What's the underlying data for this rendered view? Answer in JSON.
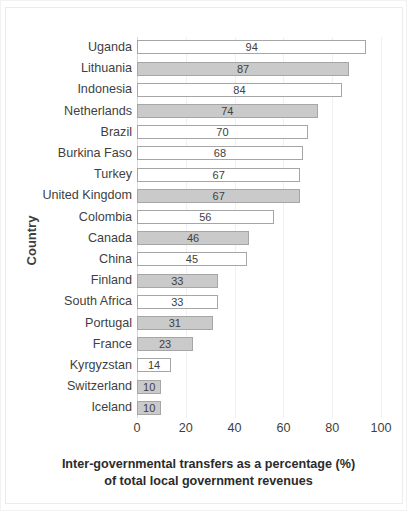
{
  "chart_data": {
    "type": "bar",
    "orientation": "horizontal",
    "title": "",
    "xlabel_line1": "Inter-governmental transfers as a percentage (%)",
    "xlabel_line2": "of  total local government revenues",
    "ylabel": "Country",
    "xlim": [
      0,
      100
    ],
    "xticks": [
      0,
      20,
      40,
      60,
      80,
      100
    ],
    "xtick_labels": [
      "0",
      "20",
      "40",
      "60",
      "80",
      "100"
    ],
    "grid": "vertical-light",
    "legend": "none",
    "categories": [
      "Uganda",
      "Lithuania",
      "Indonesia",
      "Netherlands",
      "Brazil",
      "Burkina Faso",
      "Turkey",
      "United Kingdom",
      "Colombia",
      "Canada",
      "China",
      "Finland",
      "South Africa",
      "Portugal",
      "France",
      "Kyrgyzstan",
      "Switzerland",
      "Iceland"
    ],
    "values": [
      94,
      87,
      84,
      74,
      70,
      68,
      67,
      67,
      56,
      46,
      45,
      33,
      33,
      31,
      23,
      14,
      10,
      10
    ],
    "value_labels": [
      "94",
      "87",
      "84",
      "74",
      "70",
      "68",
      "67",
      "67",
      "56",
      "46",
      "45",
      "33",
      "33",
      "31",
      "23",
      "14",
      "10",
      "10"
    ],
    "bar_fills": [
      "white",
      "gray",
      "white",
      "gray",
      "white",
      "white",
      "white",
      "gray",
      "white",
      "gray",
      "white",
      "gray",
      "white",
      "gray",
      "gray",
      "white",
      "gray",
      "gray"
    ],
    "colors": {
      "bar_gray": "#cacaca",
      "bar_white": "#ffffff",
      "bar_border": "#a6a6a6",
      "text": "#3f3f3f",
      "gridline": "#f0f0f0",
      "axis": "#d9d9d9",
      "background": "#ffffff"
    }
  }
}
